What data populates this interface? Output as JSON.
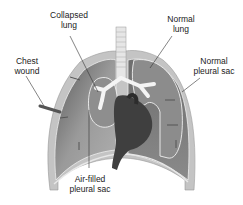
{
  "diagram": {
    "labels": {
      "collapsed_lung": {
        "line1": "Collapsed",
        "line2": "lung"
      },
      "normal_lung": {
        "line1": "Normal",
        "line2": "lung"
      },
      "chest_wound": {
        "line1": "Chest",
        "line2": "wound"
      },
      "normal_pleural_sac": {
        "line1": "Normal",
        "line2": "pleural sac"
      },
      "air_filled_pleural_sac": {
        "line1": "Air-filled",
        "line2": "pleural sac"
      }
    },
    "colors": {
      "background": "#ffffff",
      "chest_wall": "#bdbdbd",
      "pleural_cavity_left": "#8a8a8a",
      "pleural_cavity_right": "#7a7a7a",
      "lung": "#9a9a9a",
      "heart": "#3e3e3e",
      "bronchi": "#f2f2f2",
      "label_text": "#222222",
      "leader_line": "#333333"
    }
  }
}
